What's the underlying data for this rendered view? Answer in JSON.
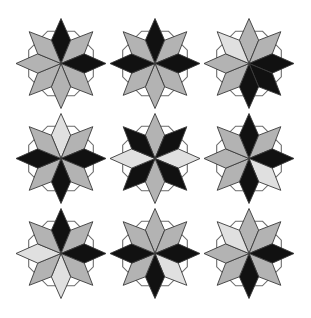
{
  "canvas": {
    "width": 311,
    "height": 318,
    "background": "#ffffff",
    "title": "Rosette Tiling Pattern"
  },
  "palette": {
    "black": "#111111",
    "gray": "#b3b3b3",
    "light": "#e0e0e0",
    "outline": "#3a3a3a",
    "frame_stroke": "#6b6b6b",
    "background": "#ffffff"
  },
  "geometry": {
    "grid_rows": 3,
    "grid_cols": 3,
    "cell_width": 94,
    "cell_height": 95,
    "origin_x": 14,
    "origin_y": 16,
    "rosette_radius": 45,
    "petal_count": 8,
    "petal_half_angle_deg": 22.5,
    "petal_waist_ratio": 0.56,
    "octagon_inradius": 30
  },
  "directions": [
    "N",
    "NE",
    "E",
    "SE",
    "S",
    "SW",
    "W",
    "NW"
  ],
  "rosettes": [
    {
      "id": "rosette-r1c1",
      "row": 1,
      "col": 1,
      "label": "top-left",
      "petals": [
        "black",
        "gray",
        "black",
        "gray",
        "gray",
        "gray",
        "gray",
        "gray"
      ]
    },
    {
      "id": "rosette-r1c2",
      "row": 1,
      "col": 2,
      "label": "top-middle",
      "petals": [
        "black",
        "gray",
        "black",
        "gray",
        "gray",
        "gray",
        "black",
        "gray"
      ]
    },
    {
      "id": "rosette-r1c3",
      "row": 1,
      "col": 3,
      "label": "top-right",
      "petals": [
        "gray",
        "gray",
        "black",
        "black",
        "black",
        "gray",
        "gray",
        "light"
      ]
    },
    {
      "id": "rosette-r2c1",
      "row": 2,
      "col": 1,
      "label": "middle-left",
      "petals": [
        "light",
        "gray",
        "black",
        "gray",
        "black",
        "gray",
        "black",
        "gray"
      ]
    },
    {
      "id": "rosette-r2c2",
      "row": 2,
      "col": 2,
      "label": "middle-center",
      "petals": [
        "gray",
        "black",
        "light",
        "black",
        "gray",
        "black",
        "light",
        "black"
      ]
    },
    {
      "id": "rosette-r2c3",
      "row": 2,
      "col": 3,
      "label": "middle-right",
      "petals": [
        "black",
        "gray",
        "black",
        "light",
        "black",
        "gray",
        "gray",
        "gray"
      ]
    },
    {
      "id": "rosette-r3c1",
      "row": 3,
      "col": 1,
      "label": "bottom-left",
      "petals": [
        "black",
        "gray",
        "black",
        "gray",
        "light",
        "gray",
        "light",
        "gray"
      ]
    },
    {
      "id": "rosette-r3c2",
      "row": 3,
      "col": 2,
      "label": "bottom-middle",
      "petals": [
        "gray",
        "gray",
        "black",
        "light",
        "black",
        "gray",
        "black",
        "gray"
      ]
    },
    {
      "id": "rosette-r3c3",
      "row": 3,
      "col": 3,
      "label": "bottom-right",
      "petals": [
        "gray",
        "gray",
        "black",
        "gray",
        "black",
        "gray",
        "gray",
        "light"
      ]
    }
  ]
}
